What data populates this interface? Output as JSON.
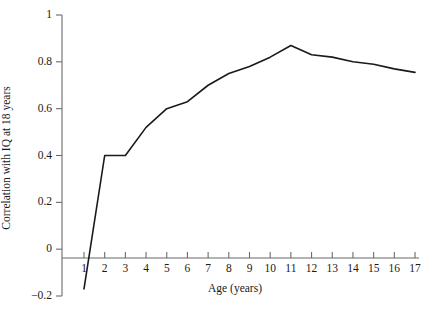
{
  "chart_data": {
    "type": "line",
    "title": "",
    "xlabel": "Age (years)",
    "ylabel": "Correlation with IQ at 18 years",
    "xlim": [
      0.6,
      17.4
    ],
    "ylim": [
      -0.2,
      1
    ],
    "grid": false,
    "legend": "none",
    "line_color": "#1a1a1a",
    "x": [
      1,
      2,
      3,
      4,
      5,
      6,
      7,
      8,
      9,
      10,
      11,
      12,
      13,
      14,
      15,
      16,
      17
    ],
    "values": [
      -0.17,
      0.4,
      0.4,
      0.52,
      0.6,
      0.63,
      0.7,
      0.75,
      0.78,
      0.82,
      0.87,
      0.83,
      0.82,
      0.8,
      0.79,
      0.77,
      0.755
    ],
    "xticks": [
      1,
      2,
      3,
      4,
      5,
      6,
      7,
      8,
      9,
      10,
      11,
      12,
      13,
      14,
      15,
      16,
      17
    ],
    "xtick_labels": [
      "1",
      "2",
      "3",
      "4",
      "5",
      "6",
      "7",
      "8",
      "9",
      "10",
      "11",
      "12",
      "13",
      "14",
      "15",
      "16",
      "17"
    ],
    "yticks": [
      -0.2,
      0,
      0.2,
      0.4,
      0.6,
      0.8,
      1
    ],
    "ytick_labels": [
      "−0.2",
      "0",
      "0.2",
      "0.4",
      "0.6",
      "0.8",
      "1"
    ]
  }
}
